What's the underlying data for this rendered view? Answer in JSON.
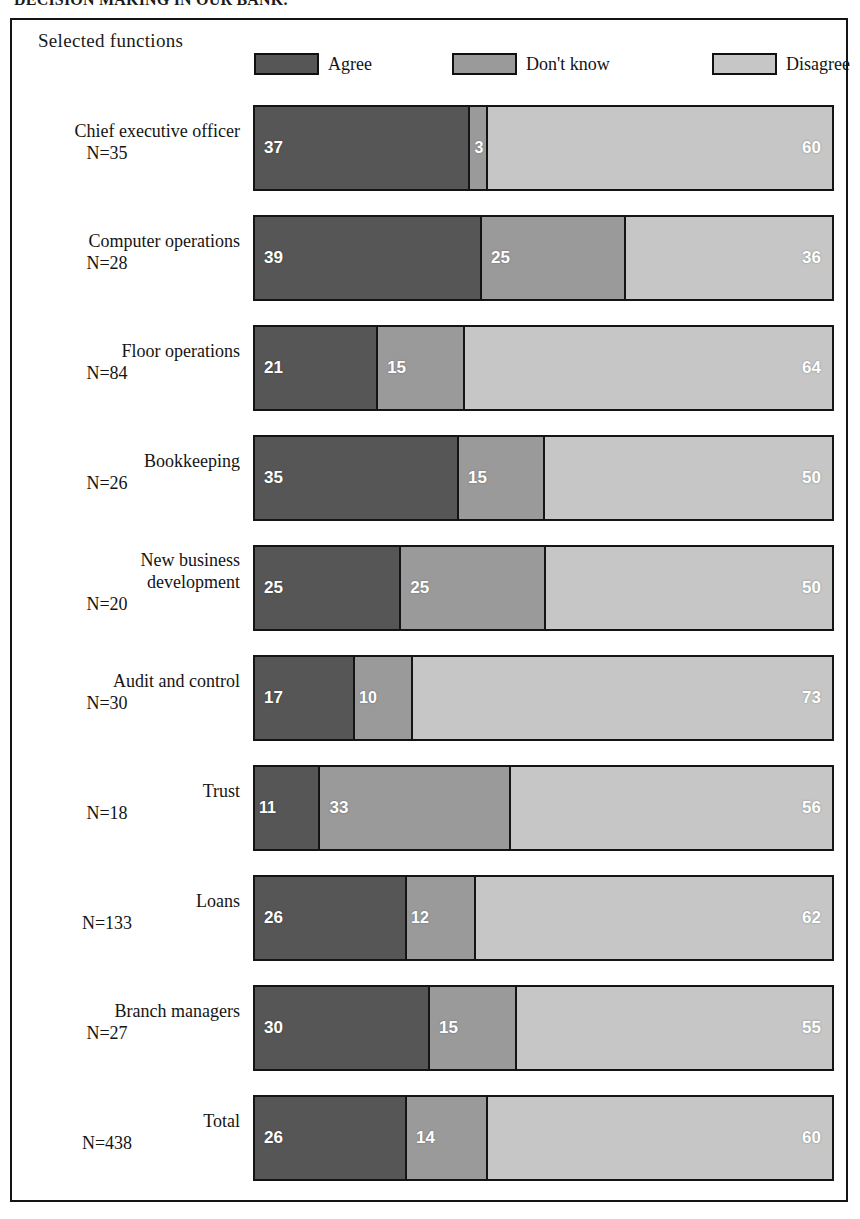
{
  "title": "DECISION MAKING IN OUR BANK.",
  "header": {
    "axis_label": "Selected functions"
  },
  "legend": [
    {
      "label": "Agree",
      "color": "#565656"
    },
    {
      "label": "Don't know",
      "color": "#9a9a9a"
    },
    {
      "label": "Disagree",
      "color": "#c6c6c6"
    }
  ],
  "colors": {
    "agree": "#565656",
    "dont_know": "#9a9a9a",
    "disagree": "#c6c6c6",
    "outline": "#141414",
    "value_text": "#ffffff",
    "background": "#ffffff"
  },
  "rows": [
    {
      "name": "Chief executive officer",
      "name2": "",
      "n": "N=35",
      "agree": 37,
      "dont_know": 3,
      "disagree": 60
    },
    {
      "name": "Computer operations",
      "name2": "",
      "n": "N=28",
      "agree": 39,
      "dont_know": 25,
      "disagree": 36
    },
    {
      "name": "Floor operations",
      "name2": "",
      "n": "N=84",
      "agree": 21,
      "dont_know": 15,
      "disagree": 64
    },
    {
      "name": "Bookkeeping",
      "name2": "",
      "n": "N=26",
      "agree": 35,
      "dont_know": 15,
      "disagree": 50
    },
    {
      "name": "New business",
      "name2": "development",
      "n": "N=20",
      "agree": 25,
      "dont_know": 25,
      "disagree": 50
    },
    {
      "name": "Audit and control",
      "name2": "",
      "n": "N=30",
      "agree": 17,
      "dont_know": 10,
      "disagree": 73
    },
    {
      "name": "Trust",
      "name2": "",
      "n": "N=18",
      "agree": 11,
      "dont_know": 33,
      "disagree": 56
    },
    {
      "name": "Loans",
      "name2": "",
      "n": "N=133",
      "agree": 26,
      "dont_know": 12,
      "disagree": 62
    },
    {
      "name": "Branch managers",
      "name2": "",
      "n": "N=27",
      "agree": 30,
      "dont_know": 15,
      "disagree": 55
    },
    {
      "name": "Total",
      "name2": "",
      "n": "N=438",
      "agree": 26,
      "dont_know": 14,
      "disagree": 60
    }
  ],
  "chart_data": {
    "type": "bar",
    "orientation": "horizontal",
    "stacked": true,
    "stack_mode": "percent",
    "title": "DECISION MAKING IN OUR BANK.",
    "xlabel": "",
    "ylabel": "Selected functions",
    "xlim": [
      0,
      100
    ],
    "grid": false,
    "legend_position": "top",
    "categories": [
      "Chief executive officer N=35",
      "Computer operations N=28",
      "Floor operations N=84",
      "Bookkeeping N=26",
      "New business development N=20",
      "Audit and control N=30",
      "Trust N=18",
      "Loans N=133",
      "Branch managers N=27",
      "Total N=438"
    ],
    "sample_sizes": [
      35,
      28,
      84,
      26,
      20,
      30,
      18,
      133,
      27,
      438
    ],
    "series": [
      {
        "name": "Agree",
        "color": "#565656",
        "values": [
          37,
          39,
          21,
          35,
          25,
          17,
          11,
          26,
          30,
          26
        ]
      },
      {
        "name": "Don't know",
        "color": "#9a9a9a",
        "values": [
          3,
          25,
          15,
          15,
          25,
          10,
          33,
          12,
          15,
          14
        ]
      },
      {
        "name": "Disagree",
        "color": "#c6c6c6",
        "values": [
          60,
          36,
          64,
          50,
          50,
          73,
          56,
          62,
          55,
          60
        ]
      }
    ]
  }
}
